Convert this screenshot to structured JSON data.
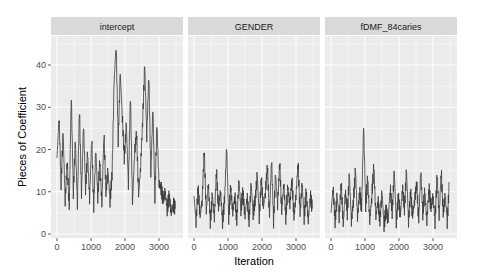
{
  "chart_data": {
    "type": "line",
    "title": "",
    "xlabel": "Iteration",
    "ylabel": "Pieces of Coefficient",
    "xlim": [
      0,
      3500
    ],
    "ylim": [
      0,
      45
    ],
    "x_ticks": [
      0,
      1000,
      2000,
      3000
    ],
    "y_ticks": [
      0,
      10,
      20,
      30,
      40
    ],
    "grid": true,
    "legend": "none",
    "facets": [
      {
        "name": "intercept",
        "x": [
          0,
          60,
          120,
          180,
          240,
          300,
          360,
          420,
          480,
          540,
          600,
          660,
          720,
          780,
          840,
          900,
          960,
          1020,
          1080,
          1140,
          1200,
          1260,
          1320,
          1380,
          1440,
          1500,
          1560,
          1620,
          1680,
          1740,
          1800,
          1860,
          1920,
          1980,
          2040,
          2100,
          2160,
          2220,
          2280,
          2340,
          2400,
          2460,
          2520,
          2580,
          2640,
          2700,
          2760,
          2820,
          2880,
          2940,
          3000,
          3060,
          3120,
          3180,
          3240,
          3300,
          3360,
          3420,
          3480
        ],
        "values": [
          18,
          28,
          12,
          24,
          8,
          17,
          6,
          33,
          10,
          22,
          7,
          30,
          9,
          26,
          11,
          19,
          8,
          23,
          6,
          20,
          9,
          17,
          7,
          24,
          10,
          15,
          8,
          14,
          36,
          45,
          22,
          38,
          28,
          18,
          26,
          12,
          33,
          7,
          19,
          24,
          9,
          16,
          27,
          40,
          23,
          38,
          14,
          30,
          9,
          26,
          12,
          11,
          8,
          10,
          6,
          9,
          5,
          7,
          6
        ],
        "color": "#3a3a3a"
      },
      {
        "name": "GENDER",
        "x": [
          0,
          60,
          120,
          180,
          240,
          300,
          360,
          420,
          480,
          540,
          600,
          660,
          720,
          780,
          840,
          900,
          960,
          1020,
          1080,
          1140,
          1200,
          1260,
          1320,
          1380,
          1440,
          1500,
          1560,
          1620,
          1680,
          1740,
          1800,
          1860,
          1920,
          1980,
          2040,
          2100,
          2160,
          2220,
          2280,
          2340,
          2400,
          2460,
          2520,
          2580,
          2640,
          2700,
          2760,
          2820,
          2880,
          2940,
          3000,
          3060,
          3120,
          3180,
          3240,
          3300,
          3360,
          3420,
          3480
        ],
        "values": [
          9,
          3,
          11,
          4,
          8,
          20,
          5,
          12,
          3,
          9,
          4,
          15,
          6,
          10,
          3,
          8,
          21,
          4,
          11,
          5,
          9,
          3,
          13,
          6,
          10,
          4,
          9,
          3,
          12,
          5,
          8,
          14,
          4,
          13,
          6,
          10,
          16,
          4,
          18,
          3,
          14,
          7,
          17,
          5,
          12,
          4,
          11,
          7,
          13,
          4,
          9,
          17,
          5,
          12,
          4,
          10,
          3,
          9,
          6
        ],
        "color": "#3a3a3a"
      },
      {
        "name": "fDMF_84caries",
        "x": [
          0,
          60,
          120,
          180,
          240,
          300,
          360,
          420,
          480,
          540,
          600,
          660,
          720,
          780,
          840,
          900,
          960,
          1020,
          1080,
          1140,
          1200,
          1260,
          1320,
          1380,
          1440,
          1500,
          1560,
          1620,
          1680,
          1740,
          1800,
          1860,
          1920,
          1980,
          2040,
          2100,
          2160,
          2220,
          2280,
          2340,
          2400,
          2460,
          2520,
          2580,
          2640,
          2700,
          2760,
          2820,
          2880,
          2940,
          3000,
          3060,
          3120,
          3180,
          3240,
          3300,
          3360,
          3420,
          3480
        ],
        "values": [
          5,
          11,
          3,
          9,
          4,
          12,
          2,
          10,
          5,
          14,
          3,
          8,
          15,
          4,
          10,
          6,
          26,
          7,
          13,
          3,
          9,
          16,
          4,
          8,
          3,
          10,
          2,
          6,
          3,
          11,
          5,
          15,
          3,
          9,
          4,
          11,
          6,
          15,
          3,
          10,
          4,
          8,
          12,
          3,
          15,
          5,
          10,
          3,
          11,
          6,
          9,
          3,
          14,
          4,
          15,
          5,
          9,
          3,
          12
        ],
        "color": "#3a3a3a"
      }
    ]
  },
  "strips": [
    "intercept",
    "GENDER",
    "fDMF_84caries"
  ],
  "axes": {
    "xlabel": "Iteration",
    "ylabel": "Pieces of Coefficient",
    "x_tick_labels": [
      "0",
      "1000",
      "2000",
      "3000"
    ],
    "y_tick_labels": [
      "0",
      "10",
      "20",
      "30",
      "40"
    ]
  },
  "colors": {
    "panel_bg": "#ebebeb",
    "strip_bg": "#d9d9d9",
    "grid_major": "#ffffff",
    "line": "#3a3a3a"
  }
}
